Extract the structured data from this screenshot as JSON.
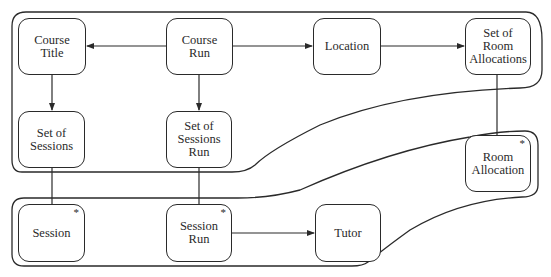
{
  "diagram": {
    "type": "entity-structure",
    "nodes": [
      {
        "id": "course-title",
        "label": "Course\nTitle",
        "multiple": false
      },
      {
        "id": "course-run",
        "label": "Course\nRun",
        "multiple": false
      },
      {
        "id": "location",
        "label": "Location",
        "multiple": false
      },
      {
        "id": "set-of-room-allocations",
        "label": "Set of\nRoom\nAllocations",
        "multiple": false
      },
      {
        "id": "set-of-sessions",
        "label": "Set of\nSessions",
        "multiple": false
      },
      {
        "id": "set-of-sessions-run",
        "label": "Set of\nSessions Run",
        "multiple": false
      },
      {
        "id": "room-allocation",
        "label": "Room\nAllocation",
        "multiple": true,
        "marker": "*"
      },
      {
        "id": "session",
        "label": "Session",
        "multiple": true,
        "marker": "*"
      },
      {
        "id": "session-run",
        "label": "Session\nRun",
        "multiple": true,
        "marker": "*"
      },
      {
        "id": "tutor",
        "label": "Tutor",
        "multiple": false
      }
    ],
    "edges": [
      {
        "from": "course-run",
        "to": "course-title",
        "arrow": true
      },
      {
        "from": "course-run",
        "to": "location",
        "arrow": true
      },
      {
        "from": "location",
        "to": "set-of-room-allocations",
        "arrow": true
      },
      {
        "from": "course-title",
        "to": "set-of-sessions",
        "arrow": true
      },
      {
        "from": "course-run",
        "to": "set-of-sessions-run",
        "arrow": true
      },
      {
        "from": "set-of-sessions",
        "to": "session",
        "arrow": false
      },
      {
        "from": "set-of-sessions-run",
        "to": "session-run",
        "arrow": false
      },
      {
        "from": "set-of-room-allocations",
        "to": "room-allocation",
        "arrow": false
      },
      {
        "from": "session-run",
        "to": "tutor",
        "arrow": true
      }
    ],
    "groups": [
      {
        "id": "upper-group",
        "members": [
          "course-title",
          "course-run",
          "location",
          "set-of-room-allocations",
          "set-of-sessions",
          "set-of-sessions-run"
        ]
      },
      {
        "id": "lower-group",
        "members": [
          "session",
          "session-run",
          "tutor",
          "room-allocation"
        ]
      }
    ]
  }
}
